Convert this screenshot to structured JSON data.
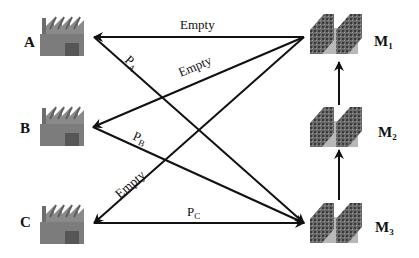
{
  "diagram": {
    "colors": {
      "line": "#111111",
      "factory_body": "#7a7a7a",
      "factory_door": "#555555",
      "machine": "#5a5a5a",
      "background": "#ffffff"
    },
    "factories": [
      {
        "id": "A",
        "label": "A",
        "icon": "factory-icon"
      },
      {
        "id": "B",
        "label": "B",
        "icon": "factory-icon"
      },
      {
        "id": "C",
        "label": "C",
        "icon": "factory-icon"
      }
    ],
    "machines": [
      {
        "id": "M1",
        "label_main": "M",
        "label_sub": "1",
        "icon": "machine-rack-icon"
      },
      {
        "id": "M2",
        "label_main": "M",
        "label_sub": "2",
        "icon": "machine-rack-icon"
      },
      {
        "id": "M3",
        "label_main": "M",
        "label_sub": "3",
        "icon": "machine-rack-icon"
      }
    ],
    "edges": [
      {
        "from": "M1",
        "to": "A",
        "label": "Empty"
      },
      {
        "from": "M1",
        "to": "B",
        "label": "Empty"
      },
      {
        "from": "M1",
        "to": "C",
        "label": "Empty"
      },
      {
        "from": "A",
        "to": "M3",
        "label_main": "P",
        "label_sub": "A"
      },
      {
        "from": "B",
        "to": "M3",
        "label_main": "P",
        "label_sub": "B"
      },
      {
        "from": "C",
        "to": "M3",
        "label_main": "P",
        "label_sub": "C"
      },
      {
        "from": "M3",
        "to": "M2",
        "label": ""
      },
      {
        "from": "M2",
        "to": "M1",
        "label": ""
      }
    ]
  }
}
